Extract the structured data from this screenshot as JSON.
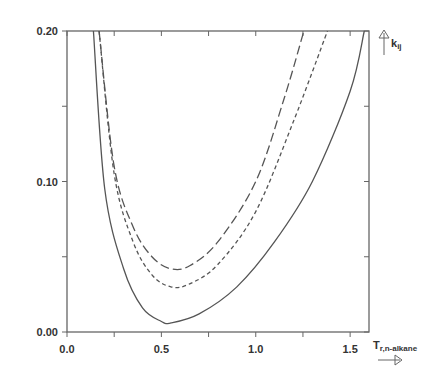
{
  "chart_data": {
    "type": "line",
    "title": "",
    "xlabel": "T",
    "xlabel_sub": "r,n-alkane",
    "ylabel": "k",
    "ylabel_sub": "ij",
    "xlim": [
      0.0,
      1.6
    ],
    "ylim": [
      0.0,
      0.2
    ],
    "x_ticks": [
      "0.0",
      "0.5",
      "1.0",
      "1.5"
    ],
    "y_ticks": [
      "0.00",
      "0.10",
      "0.20"
    ],
    "grid": false,
    "legend": "none",
    "series": [
      {
        "name": "solid",
        "style": "solid",
        "x": [
          0.14,
          0.2,
          0.3,
          0.4,
          0.5,
          0.55,
          0.7,
          0.9,
          1.1,
          1.3,
          1.5,
          1.575
        ],
        "y": [
          0.2,
          0.095,
          0.042,
          0.016,
          0.007,
          0.006,
          0.012,
          0.03,
          0.06,
          0.1,
          0.16,
          0.2
        ]
      },
      {
        "name": "short-dash",
        "style": "short-dash",
        "x": [
          0.17,
          0.25,
          0.35,
          0.45,
          0.55,
          0.65,
          0.8,
          1.0,
          1.2,
          1.38
        ],
        "y": [
          0.2,
          0.105,
          0.06,
          0.038,
          0.03,
          0.032,
          0.045,
          0.08,
          0.14,
          0.2
        ]
      },
      {
        "name": "long-dash",
        "style": "long-dash",
        "x": [
          0.17,
          0.25,
          0.35,
          0.45,
          0.55,
          0.65,
          0.8,
          1.0,
          1.15,
          1.255
        ],
        "y": [
          0.2,
          0.11,
          0.07,
          0.05,
          0.042,
          0.044,
          0.06,
          0.1,
          0.155,
          0.2
        ]
      }
    ]
  }
}
